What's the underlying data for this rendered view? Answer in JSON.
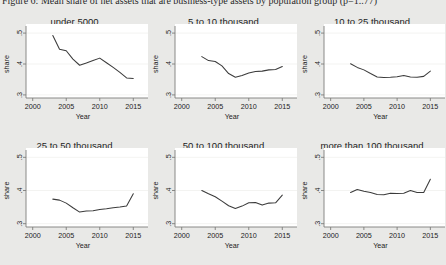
{
  "figure": {
    "caption": "Figure 6: Mean share of net assets that are business-type assets by population group (p=1..77)"
  },
  "chart_data": {
    "type": "line",
    "title": "Mean share of net assets that are business-type assets by population group",
    "xlabel": "Year",
    "ylabel": "share",
    "xlim": [
      1999,
      2016
    ],
    "ylim": [
      0.29,
      0.51
    ],
    "xticks": [
      "2000",
      "2005",
      "2010",
      "2015"
    ],
    "xtick_values": [
      2000,
      2005,
      2010,
      2015
    ],
    "yticks": [
      ".5",
      ".4",
      ".3"
    ],
    "ytick_values": [
      0.5,
      0.4,
      0.3
    ],
    "grid": "horizontal-light",
    "legend": "none",
    "panels": [
      {
        "label": "under 5000",
        "x": [
          2003,
          2004,
          2005,
          2006,
          2007,
          2008,
          2009,
          2010,
          2011,
          2012,
          2013,
          2014,
          2015
        ],
        "values": [
          0.492,
          0.448,
          0.443,
          0.416,
          0.396,
          0.403,
          0.411,
          0.419,
          0.404,
          0.389,
          0.373,
          0.355,
          0.353
        ]
      },
      {
        "label": "5 to 10 thousand",
        "x": [
          2003,
          2004,
          2005,
          2006,
          2007,
          2008,
          2009,
          2010,
          2011,
          2012,
          2013,
          2014,
          2015
        ],
        "values": [
          0.424,
          0.411,
          0.408,
          0.394,
          0.369,
          0.357,
          0.363,
          0.371,
          0.376,
          0.377,
          0.381,
          0.382,
          0.392
        ]
      },
      {
        "label": "10 to 25 thousand",
        "x": [
          2003,
          2004,
          2005,
          2006,
          2007,
          2008,
          2009,
          2010,
          2011,
          2012,
          2013,
          2014,
          2015
        ],
        "values": [
          0.401,
          0.389,
          0.381,
          0.369,
          0.358,
          0.356,
          0.357,
          0.359,
          0.363,
          0.358,
          0.357,
          0.36,
          0.377
        ]
      },
      {
        "label": "25 to 50 thousand",
        "x": [
          2003,
          2004,
          2005,
          2006,
          2007,
          2008,
          2009,
          2010,
          2011,
          2012,
          2013,
          2014,
          2015
        ],
        "values": [
          0.374,
          0.371,
          0.362,
          0.348,
          0.335,
          0.338,
          0.339,
          0.343,
          0.345,
          0.348,
          0.35,
          0.353,
          0.39
        ]
      },
      {
        "label": "50 to 100 thousand",
        "x": [
          2003,
          2004,
          2005,
          2006,
          2007,
          2008,
          2009,
          2010,
          2011,
          2012,
          2013,
          2014,
          2015
        ],
        "values": [
          0.4,
          0.39,
          0.381,
          0.368,
          0.354,
          0.346,
          0.353,
          0.363,
          0.364,
          0.356,
          0.362,
          0.363,
          0.386
        ]
      },
      {
        "label": "more than 100 thousand",
        "x": [
          2003,
          2004,
          2005,
          2006,
          2007,
          2008,
          2009,
          2010,
          2011,
          2012,
          2013,
          2014,
          2015
        ],
        "values": [
          0.394,
          0.403,
          0.398,
          0.394,
          0.388,
          0.387,
          0.392,
          0.391,
          0.392,
          0.4,
          0.394,
          0.394,
          0.434
        ]
      }
    ]
  }
}
